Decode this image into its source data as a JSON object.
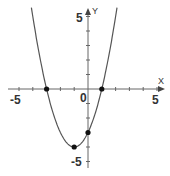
{
  "chart_data": {
    "type": "line",
    "title": "",
    "function": "y = x^2 + 2x - 3",
    "xlabel": "X",
    "ylabel": "Y",
    "xlim": [
      -5.5,
      5.5
    ],
    "ylim": [
      -5.5,
      5.5
    ],
    "tick_labels": {
      "x": [
        "-5",
        "0",
        "5"
      ],
      "y": [
        "5",
        "-5"
      ]
    },
    "grid": false,
    "series": [
      {
        "name": "parabola",
        "x": [
          -4.1,
          -4,
          -3,
          -2,
          -1,
          0,
          1,
          2,
          2.1
        ],
        "values": [
          4.61,
          5,
          0,
          -3,
          -4,
          -3,
          0,
          5,
          5.61
        ]
      }
    ],
    "points": [
      {
        "label": "root-left",
        "x": -3,
        "y": 0
      },
      {
        "label": "root-right",
        "x": 1,
        "y": 0
      },
      {
        "label": "vertex",
        "x": -1,
        "y": -4
      },
      {
        "label": "y-intercept",
        "x": 0,
        "y": -3
      }
    ],
    "colors": {
      "curve": "#555555",
      "axis": "#555555",
      "point": "#111111"
    }
  },
  "labels": {
    "x_axis": "X",
    "y_axis": "Y",
    "x_min": "-5",
    "x_max": "5",
    "origin": "0",
    "y_max": "5",
    "y_min": "-5"
  }
}
